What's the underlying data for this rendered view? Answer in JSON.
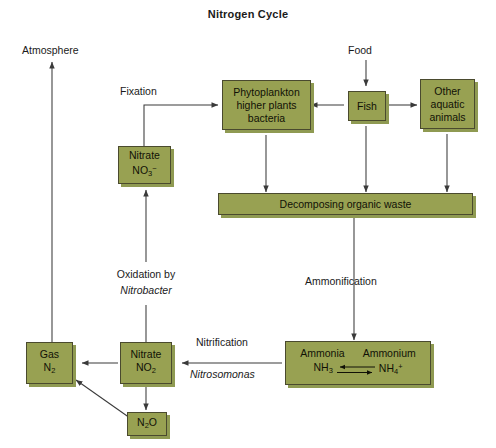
{
  "title": "Nitrogen Cycle",
  "colors": {
    "box_fill": "#98a152",
    "box_border": "#4a4a2e",
    "shadow": "#8f9a52",
    "line": "#3a3a3a",
    "background": "#ffffff",
    "text": "#1a1a1a"
  },
  "boxes": {
    "phytoplankton": {
      "line1": "Phytoplankton",
      "line2": "higher plants",
      "line3": "bacteria"
    },
    "fish": {
      "line1": "Fish"
    },
    "other_animals": {
      "line1": "Other",
      "line2": "aquatic",
      "line3": "animals"
    },
    "decomposing": {
      "line1": "Decomposing organic waste"
    },
    "nitrate_no3": {
      "line1": "Nitrate",
      "formula_main": "NO",
      "formula_sub": "3",
      "formula_sup": "−"
    },
    "nitrate_no2": {
      "line1": "Nitrate",
      "formula_main": "NO",
      "formula_sub": "2"
    },
    "gas_n2": {
      "line1": "Gas",
      "formula_main": "N",
      "formula_sub": "2"
    },
    "n2o": {
      "formula_a": "N",
      "formula_sub": "2",
      "formula_b": "O"
    },
    "ammonia_ammonium": {
      "left_name": "Ammonia",
      "right_name": "Ammonium",
      "left_formula_main": "NH",
      "left_formula_sub": "3",
      "right_formula_main": "NH",
      "right_formula_sub": "4",
      "right_formula_sup": "+"
    }
  },
  "labels": {
    "atmosphere": "Atmosphere",
    "food": "Food",
    "fixation": "Fixation",
    "oxidation_by": "Oxidation by",
    "nitrobacter": "Nitrobacter",
    "ammonification": "Ammonification",
    "nitrification": "Nitrification",
    "nitrosomonas": "Nitrosomonas"
  }
}
